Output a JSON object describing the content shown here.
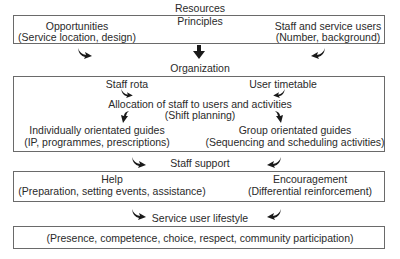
{
  "resources": {
    "heading": "Resources",
    "principles": "Principles",
    "opportunities": {
      "title": "Opportunities",
      "detail": "(Service location, design)"
    },
    "staff_users": {
      "title": "Staff and service users",
      "detail": "(Number, background)"
    }
  },
  "organization": {
    "heading": "Organization",
    "staff_rota": "Staff rota",
    "user_timetable": "User timetable",
    "allocation": {
      "title": "Allocation of staff to users and activities",
      "detail": "(Shift planning)"
    },
    "individual_guides": {
      "title": "Individually orientated guides",
      "detail": "(IP, programmes, prescriptions)"
    },
    "group_guides": {
      "title": "Group orientated guides",
      "detail": "(Sequencing and scheduling activities)"
    }
  },
  "staff_support": {
    "heading": "Staff support",
    "help": {
      "title": "Help",
      "detail": "(Preparation, setting events, assistance)"
    },
    "encouragement": {
      "title": "Encouragement",
      "detail": "(Differential reinforcement)"
    }
  },
  "lifestyle": {
    "heading": "Service user lifestyle",
    "detail": "(Presence, competence, choice, respect, community participation)"
  },
  "colors": {
    "border": "#6a6a6a",
    "text": "#2a2a2a",
    "arrow": "#1a1a1a"
  }
}
